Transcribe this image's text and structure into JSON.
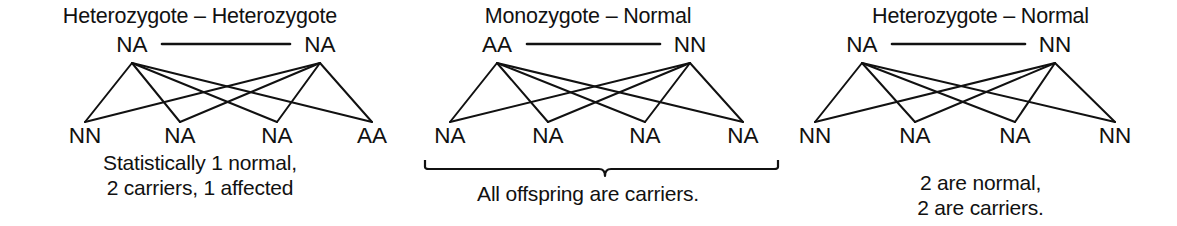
{
  "figure": {
    "type": "genetic-cross-diagram",
    "background_color": "#ffffff",
    "line_color": "#111111",
    "text_color": "#111111"
  },
  "panels": [
    {
      "id": "heterozygote-heterozygote",
      "title": "Heterozygote – Heterozygote",
      "parents": [
        {
          "label": "NA",
          "x": 132
        },
        {
          "label": "NA",
          "x": 320
        }
      ],
      "offspring": [
        {
          "label": "NN",
          "x": 85
        },
        {
          "label": "NA",
          "x": 180
        },
        {
          "label": "NA",
          "x": 277
        },
        {
          "label": "AA",
          "x": 372
        }
      ],
      "caption": "Statistically 1 normal,\n2 carriers, 1 affected",
      "brace": false
    },
    {
      "id": "monozygote-normal",
      "title": "Monozygote – Normal",
      "parents": [
        {
          "label": "AA",
          "x": 105
        },
        {
          "label": "NN",
          "x": 298
        }
      ],
      "offspring": [
        {
          "label": "NA",
          "x": 58
        },
        {
          "label": "NA",
          "x": 156
        },
        {
          "label": "NA",
          "x": 253
        },
        {
          "label": "NA",
          "x": 351
        }
      ],
      "caption": "All offspring are carriers.",
      "brace": true,
      "brace_geometry": {
        "x1": 33,
        "x2": 386,
        "y": 168,
        "notch_x": 213,
        "notch_depth": 8
      }
    },
    {
      "id": "heterozygote-normal",
      "title": "Heterozygote – Normal",
      "parents": [
        {
          "label": "NA",
          "x": 78
        },
        {
          "label": "NN",
          "x": 271
        }
      ],
      "offspring": [
        {
          "label": "NN",
          "x": 31
        },
        {
          "label": "NA",
          "x": 131
        },
        {
          "label": "NA",
          "x": 231
        },
        {
          "label": "NN",
          "x": 331
        }
      ],
      "caption": "2 are normal,\n2 are carriers.",
      "brace": false
    }
  ],
  "geometry": {
    "parent_label_baseline_y": 52,
    "parent_apex_y": 63,
    "offspring_vertex_y": 122,
    "offspring_label_baseline_y": 143,
    "mating_line_y": 44
  }
}
